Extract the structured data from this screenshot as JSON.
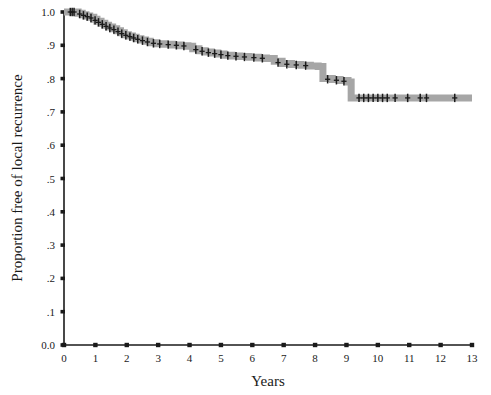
{
  "chart_data": {
    "type": "line",
    "subtype": "kaplan-meier-step",
    "title": "",
    "xlabel": "Years",
    "ylabel": "Proportion free of local recurrence",
    "xlim": [
      0,
      13
    ],
    "ylim": [
      0,
      1
    ],
    "grid": false,
    "legend": null,
    "xticks": [
      0,
      1,
      2,
      3,
      4,
      5,
      6,
      7,
      8,
      9,
      10,
      11,
      12,
      13
    ],
    "xticklabels": [
      "0",
      "1",
      "2",
      "3",
      "4",
      "5",
      "6",
      "7",
      "8",
      "9",
      "10",
      "11",
      "12",
      "13"
    ],
    "yticks": [
      0.0,
      0.1,
      0.2,
      0.3,
      0.4,
      0.5,
      0.6,
      0.7,
      0.8,
      0.9,
      1.0
    ],
    "yticklabels": [
      "0.0",
      ".1",
      ".2",
      ".3",
      ".4",
      ".5",
      ".6",
      ".7",
      ".8",
      ".9",
      "1.0"
    ],
    "series": [
      {
        "name": "Proportion free of local recurrence",
        "color": "#a6a6a6",
        "line_width_px": 7,
        "step_points": [
          [
            0.0,
            1.0
          ],
          [
            0.35,
            1.0
          ],
          [
            0.45,
            0.996
          ],
          [
            0.58,
            0.992
          ],
          [
            0.7,
            0.988
          ],
          [
            0.82,
            0.984
          ],
          [
            0.95,
            0.978
          ],
          [
            1.05,
            0.972
          ],
          [
            1.18,
            0.966
          ],
          [
            1.3,
            0.96
          ],
          [
            1.42,
            0.955
          ],
          [
            1.55,
            0.95
          ],
          [
            1.68,
            0.944
          ],
          [
            1.8,
            0.938
          ],
          [
            1.92,
            0.932
          ],
          [
            2.05,
            0.928
          ],
          [
            2.18,
            0.924
          ],
          [
            2.3,
            0.92
          ],
          [
            2.45,
            0.916
          ],
          [
            2.6,
            0.912
          ],
          [
            2.75,
            0.908
          ],
          [
            2.95,
            0.905
          ],
          [
            3.2,
            0.903
          ],
          [
            3.45,
            0.901
          ],
          [
            3.7,
            0.899
          ],
          [
            3.95,
            0.897
          ],
          [
            4.1,
            0.89
          ],
          [
            4.3,
            0.884
          ],
          [
            4.5,
            0.88
          ],
          [
            4.7,
            0.877
          ],
          [
            4.9,
            0.874
          ],
          [
            5.1,
            0.87
          ],
          [
            5.35,
            0.868
          ],
          [
            5.6,
            0.866
          ],
          [
            5.9,
            0.864
          ],
          [
            6.2,
            0.862
          ],
          [
            6.45,
            0.86
          ],
          [
            6.7,
            0.852
          ],
          [
            6.95,
            0.845
          ],
          [
            7.25,
            0.842
          ],
          [
            7.55,
            0.84
          ],
          [
            7.85,
            0.838
          ],
          [
            8.1,
            0.836
          ],
          [
            8.25,
            0.8
          ],
          [
            8.55,
            0.797
          ],
          [
            8.8,
            0.794
          ],
          [
            9.05,
            0.79
          ],
          [
            9.15,
            0.742
          ],
          [
            13.0,
            0.742
          ]
        ],
        "censor_marks": [
          [
            0.2,
            1.0
          ],
          [
            0.26,
            1.0
          ],
          [
            0.32,
            1.0
          ],
          [
            0.5,
            0.994
          ],
          [
            0.62,
            0.99
          ],
          [
            0.74,
            0.986
          ],
          [
            0.86,
            0.982
          ],
          [
            0.99,
            0.975
          ],
          [
            1.1,
            0.969
          ],
          [
            1.22,
            0.963
          ],
          [
            1.34,
            0.957
          ],
          [
            1.46,
            0.952
          ],
          [
            1.59,
            0.947
          ],
          [
            1.72,
            0.941
          ],
          [
            1.84,
            0.935
          ],
          [
            1.97,
            0.93
          ],
          [
            2.1,
            0.926
          ],
          [
            2.22,
            0.922
          ],
          [
            2.35,
            0.918
          ],
          [
            2.5,
            0.914
          ],
          [
            2.66,
            0.91
          ],
          [
            2.85,
            0.906
          ],
          [
            3.05,
            0.904
          ],
          [
            3.32,
            0.902
          ],
          [
            3.58,
            0.9
          ],
          [
            3.82,
            0.898
          ],
          [
            4.2,
            0.887
          ],
          [
            4.4,
            0.882
          ],
          [
            4.6,
            0.878
          ],
          [
            4.8,
            0.875
          ],
          [
            5.0,
            0.872
          ],
          [
            5.22,
            0.869
          ],
          [
            5.48,
            0.867
          ],
          [
            5.75,
            0.865
          ],
          [
            6.05,
            0.863
          ],
          [
            6.32,
            0.861
          ],
          [
            6.82,
            0.848
          ],
          [
            7.1,
            0.843
          ],
          [
            7.4,
            0.841
          ],
          [
            7.7,
            0.839
          ],
          [
            8.4,
            0.798
          ],
          [
            8.68,
            0.795
          ],
          [
            8.92,
            0.792
          ],
          [
            9.4,
            0.742
          ],
          [
            9.55,
            0.742
          ],
          [
            9.7,
            0.742
          ],
          [
            9.85,
            0.742
          ],
          [
            10.0,
            0.742
          ],
          [
            10.15,
            0.742
          ],
          [
            10.3,
            0.742
          ],
          [
            10.55,
            0.742
          ],
          [
            10.95,
            0.742
          ],
          [
            11.35,
            0.742
          ],
          [
            11.55,
            0.742
          ],
          [
            12.45,
            0.742
          ]
        ]
      }
    ],
    "annotations": []
  },
  "axes": {
    "x_title": "Years",
    "y_title": "Proportion free of local recurrence"
  },
  "colors": {
    "curve": "#a6a6a6",
    "censor": "#1a1a1a",
    "axis": "#1a1a1a",
    "background": "#ffffff"
  }
}
